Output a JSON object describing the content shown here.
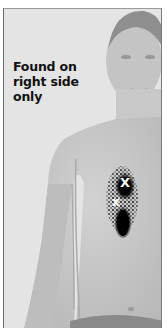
{
  "caption": {
    "lines": [
      "Found on",
      "right side",
      "only"
    ]
  },
  "markers": {
    "upper": "X",
    "lower": "x"
  },
  "colors": {
    "background": "#e4e4e4",
    "skin_light": "#cfcfcf",
    "skin_shadow": "#a8a8a8",
    "pain_pattern": "#0a0a0a",
    "marker": "#ffffff",
    "text": "#111111"
  }
}
